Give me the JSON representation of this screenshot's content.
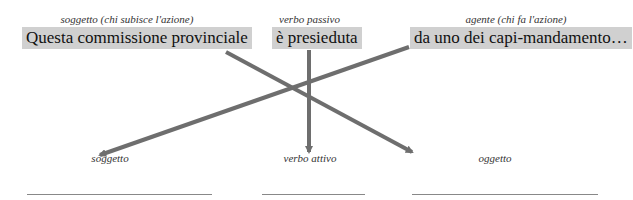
{
  "passive": {
    "subject": {
      "caption": "soggetto (chi subisce l'azione)",
      "text": "Questa commissione provinciale"
    },
    "verb": {
      "caption": "verbo passivo",
      "text": "è presieduta"
    },
    "agent": {
      "caption": "agente (chi fa l'azione)",
      "text": "da uno dei capi-mandamento…"
    }
  },
  "active": {
    "subject": {
      "caption": "soggetto",
      "answer": ""
    },
    "verb": {
      "caption": "verbo attivo",
      "answer": ""
    },
    "object": {
      "caption": "oggetto",
      "answer": ""
    }
  },
  "colors": {
    "box": "#d0d0d0",
    "arrow": "#6e6e6e",
    "line": "#888888"
  }
}
